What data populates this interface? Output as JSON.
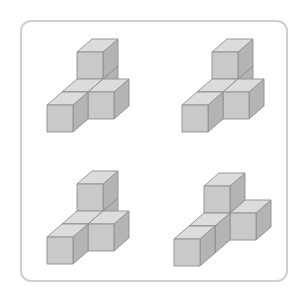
{
  "colors": {
    "background": "#ffffff",
    "frame_border": "#cfcfcf",
    "cube_front": "#c9c9c9",
    "cube_top": "#dcdcdc",
    "cube_side": "#b4b4b4",
    "cube_edge": "#8e8e8e"
  },
  "projection": {
    "unit_x": [
      26,
      0
    ],
    "unit_y": [
      0,
      -27
    ],
    "unit_z": [
      15,
      -13
    ]
  },
  "figures": [
    {
      "name": "figure-top-left",
      "origin": [
        47,
        132
      ],
      "cubes": [
        [
          0,
          0,
          2
        ],
        [
          0,
          1,
          2
        ],
        [
          0,
          0,
          1
        ],
        [
          1,
          0,
          1
        ],
        [
          0,
          0,
          0
        ]
      ]
    },
    {
      "name": "figure-top-right",
      "origin": [
        182,
        132
      ],
      "cubes": [
        [
          0,
          0,
          2
        ],
        [
          0,
          1,
          2
        ],
        [
          0,
          0,
          1
        ],
        [
          1,
          0,
          1
        ],
        [
          0,
          0,
          0
        ]
      ]
    },
    {
      "name": "figure-bottom-left",
      "origin": [
        47,
        264
      ],
      "cubes": [
        [
          0,
          0,
          2
        ],
        [
          0,
          1,
          2
        ],
        [
          0,
          0,
          1
        ],
        [
          1,
          0,
          1
        ],
        [
          0,
          0,
          0
        ]
      ]
    },
    {
      "name": "figure-bottom-right",
      "origin": [
        174,
        266
      ],
      "cubes": [
        [
          0,
          0,
          2
        ],
        [
          0,
          1,
          2
        ],
        [
          1,
          0,
          2
        ],
        [
          0,
          0,
          1
        ],
        [
          0,
          0,
          0
        ]
      ]
    }
  ]
}
